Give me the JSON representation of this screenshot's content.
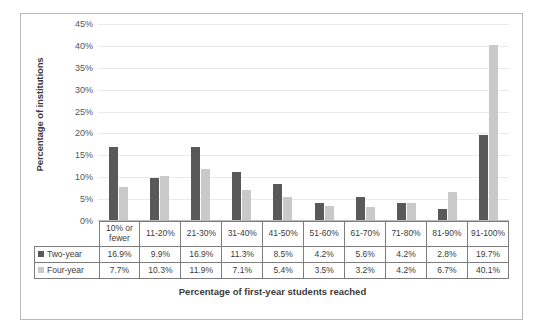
{
  "chart_data": {
    "type": "bar",
    "title": "",
    "xlabel": "Percentage of first-year students reached",
    "ylabel": "Percentage of institutions",
    "categories": [
      "10% or fewer",
      "11-20%",
      "21-30%",
      "31-40%",
      "41-50%",
      "51-60%",
      "61-70%",
      "71-80%",
      "81-90%",
      "91-100%"
    ],
    "series": [
      {
        "name": "Two-year",
        "color": "#595959",
        "values": [
          16.9,
          9.9,
          16.9,
          11.3,
          8.5,
          4.2,
          5.6,
          4.2,
          2.8,
          19.7
        ],
        "labels": [
          "16.9%",
          "9.9%",
          "16.9%",
          "11.3%",
          "8.5%",
          "4.2%",
          "5.6%",
          "4.2%",
          "2.8%",
          "19.7%"
        ]
      },
      {
        "name": "Four-year",
        "color": "#c9c9c9",
        "values": [
          7.7,
          10.3,
          11.9,
          7.1,
          5.4,
          3.5,
          3.2,
          4.2,
          6.7,
          40.1
        ],
        "labels": [
          "7.7%",
          "10.3%",
          "11.9%",
          "7.1%",
          "5.4%",
          "3.5%",
          "3.2%",
          "4.2%",
          "6.7%",
          "40.1%"
        ]
      }
    ],
    "ylim": [
      0,
      45
    ],
    "yticks": [
      "0%",
      "5%",
      "10%",
      "15%",
      "20%",
      "25%",
      "30%",
      "35%",
      "40%",
      "45%"
    ],
    "ytick_values": [
      0,
      5,
      10,
      15,
      20,
      25,
      30,
      35,
      40,
      45
    ],
    "grid": true,
    "legend_position": "data-table-left-column"
  }
}
